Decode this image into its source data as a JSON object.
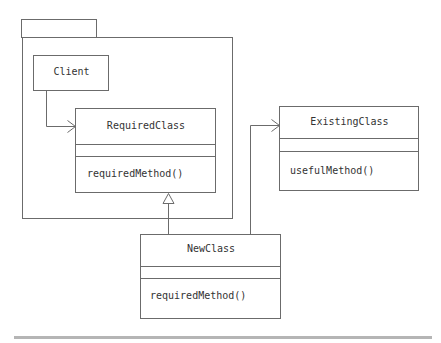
{
  "diagram": {
    "type": "UML class diagram (Adapter pattern)",
    "package": {
      "label": ""
    },
    "classes": [
      {
        "id": "client",
        "name": "Client",
        "attributes": [],
        "methods": []
      },
      {
        "id": "required",
        "name": "RequiredClass",
        "attributes": [],
        "methods": [
          "requiredMethod()"
        ]
      },
      {
        "id": "existing",
        "name": "ExistingClass",
        "attributes": [],
        "methods": [
          "usefulMethod()"
        ]
      },
      {
        "id": "newclass",
        "name": "NewClass",
        "attributes": [],
        "methods": [
          "requiredMethod()"
        ]
      }
    ],
    "relations": [
      {
        "from": "Client",
        "to": "RequiredClass",
        "kind": "association"
      },
      {
        "from": "NewClass",
        "to": "RequiredClass",
        "kind": "generalization"
      },
      {
        "from": "NewClass",
        "to": "ExistingClass",
        "kind": "association"
      }
    ],
    "colors": {
      "line": "#6b6b6b",
      "text": "#333333",
      "bar": "#b5b5b5"
    }
  }
}
